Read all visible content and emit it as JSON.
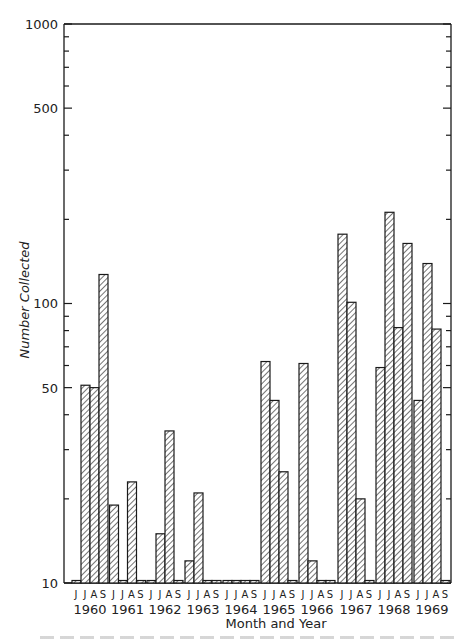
{
  "chart_data": {
    "type": "bar",
    "title": "",
    "xlabel": "Month and Year",
    "ylabel": "Number Collected",
    "yscale": "log",
    "ylim": [
      10,
      1000
    ],
    "y_ticks_labeled": [
      10,
      50,
      100,
      500,
      1000
    ],
    "y_ticks_minor": [
      20,
      30,
      40,
      60,
      70,
      80,
      90,
      200,
      300,
      400,
      600,
      700,
      800,
      900
    ],
    "grid": false,
    "legend": null,
    "months": [
      "J",
      "J",
      "A",
      "S"
    ],
    "month_names": [
      "June",
      "July",
      "August",
      "September"
    ],
    "years": [
      "1960",
      "1961",
      "1962",
      "1963",
      "1964",
      "1965",
      "1966",
      "1967",
      "1968",
      "1969"
    ],
    "series": [
      {
        "year": "1960",
        "values": [
          10,
          51,
          50,
          127
        ]
      },
      {
        "year": "1961",
        "values": [
          19,
          10,
          23,
          10
        ]
      },
      {
        "year": "1962",
        "values": [
          10,
          15,
          35,
          10
        ]
      },
      {
        "year": "1963",
        "values": [
          12,
          21,
          10,
          10
        ]
      },
      {
        "year": "1964",
        "values": [
          10,
          10,
          10,
          10
        ]
      },
      {
        "year": "1965",
        "values": [
          62,
          45,
          25,
          10
        ]
      },
      {
        "year": "1966",
        "values": [
          61,
          12,
          10,
          10
        ]
      },
      {
        "year": "1967",
        "values": [
          177,
          101,
          20,
          10
        ]
      },
      {
        "year": "1968",
        "values": [
          59,
          212,
          82,
          164
        ]
      },
      {
        "year": "1969",
        "values": [
          45,
          139,
          81,
          10
        ]
      }
    ]
  },
  "axis": {
    "ylabel": "Number Collected",
    "xlabel": "Month and Year",
    "tick_labels": {
      "t1000": "1000",
      "t500": "500",
      "t100": "100",
      "t50": "50",
      "t10": "10"
    }
  },
  "style": {
    "bar_stroke": "#1a1a1a",
    "hatch_color": "#2a2a2a",
    "background": "#ffffff"
  }
}
